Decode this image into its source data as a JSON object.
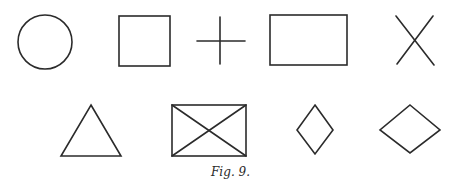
{
  "figure": {
    "caption": "Fig. 9.",
    "stroke_color": "#2b2b2b",
    "background": "#ffffff",
    "rows": [
      {
        "row": 1,
        "shapes": [
          {
            "name": "circle",
            "type": "circle",
            "cx": 45,
            "cy": 42,
            "r": 27
          },
          {
            "name": "square",
            "type": "rect",
            "x": 119,
            "y": 16,
            "w": 51,
            "h": 50
          },
          {
            "name": "plus",
            "type": "cross-orthogonal",
            "cx": 220,
            "cy": 41,
            "half_w": 24,
            "half_h": 24
          },
          {
            "name": "rectangle",
            "type": "rect",
            "x": 270,
            "y": 15,
            "w": 77,
            "h": 50
          },
          {
            "name": "x-cross",
            "type": "cross-diagonal",
            "x1": 396,
            "y1": 16,
            "x2": 434,
            "y2": 65
          }
        ]
      },
      {
        "row": 2,
        "shapes": [
          {
            "name": "triangle",
            "type": "polygon",
            "points": [
              [
                91,
                105
              ],
              [
                121,
                156
              ],
              [
                61,
                156
              ]
            ]
          },
          {
            "name": "crossed-rectangle",
            "type": "rect-with-diagonals",
            "x": 172,
            "y": 105,
            "w": 74,
            "h": 51
          },
          {
            "name": "narrow-diamond",
            "type": "polygon",
            "points": [
              [
                315,
                105
              ],
              [
                333,
                130
              ],
              [
                315,
                154
              ],
              [
                297,
                130
              ]
            ]
          },
          {
            "name": "wide-diamond",
            "type": "polygon",
            "points": [
              [
                410,
                105
              ],
              [
                440,
                130
              ],
              [
                410,
                153
              ],
              [
                380,
                130
              ]
            ]
          }
        ]
      }
    ]
  }
}
